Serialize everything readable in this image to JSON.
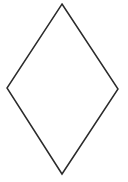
{
  "diagram": {
    "shape": "rhombus",
    "stroke_color": "#2b2b2b",
    "fill_color": "#ffffff",
    "stroke_width": 1.5,
    "vertices": {
      "top": [
        62,
        4
      ],
      "right": [
        118,
        89
      ],
      "bottom": [
        62,
        174
      ],
      "left": [
        7,
        88
      ]
    }
  }
}
